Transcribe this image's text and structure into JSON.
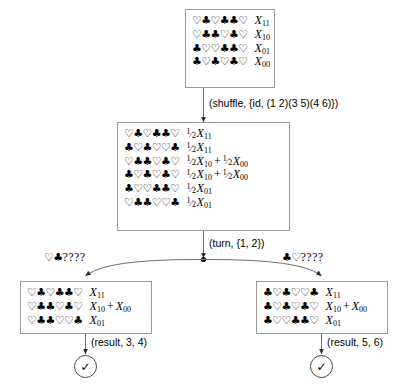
{
  "diagram": {
    "nodes": {
      "initial_state": {
        "rows": [
          {
            "cards": "♡♣♡♣♣♡",
            "value": "X",
            "sub": "11"
          },
          {
            "cards": "♡♣♣♡♣♡",
            "value": "X",
            "sub": "10"
          },
          {
            "cards": "♣♡♡♣♣♡",
            "value": "X",
            "sub": "01"
          },
          {
            "cards": "♣♡♣♡♣♡",
            "value": "X",
            "sub": "00"
          }
        ]
      },
      "shuffled_state": {
        "rows": [
          {
            "cards": "♡♣♡♣♣♡",
            "terms": [
              {
                "coef": "1/2",
                "value": "X",
                "sub": "11"
              }
            ]
          },
          {
            "cards": "♣♡♣♡♡♣",
            "terms": [
              {
                "coef": "1/2",
                "value": "X",
                "sub": "11"
              }
            ]
          },
          {
            "cards": "♡♣♣♡♣♡",
            "terms": [
              {
                "coef": "1/2",
                "value": "X",
                "sub": "10"
              },
              {
                "coef": "1/2",
                "value": "X",
                "sub": "00"
              }
            ]
          },
          {
            "cards": "♣♡♣♡♣♡",
            "terms": [
              {
                "coef": "1/2",
                "value": "X",
                "sub": "10"
              },
              {
                "coef": "1/2",
                "value": "X",
                "sub": "00"
              }
            ]
          },
          {
            "cards": "♣♡♡♣♣♡",
            "terms": [
              {
                "coef": "1/2",
                "value": "X",
                "sub": "01"
              }
            ]
          },
          {
            "cards": "♡♣♣♡♡♣",
            "terms": [
              {
                "coef": "1/2",
                "value": "X",
                "sub": "01"
              }
            ]
          }
        ]
      },
      "left_state": {
        "rows": [
          {
            "cards": "♡♣♡♣♣♡",
            "terms": [
              {
                "value": "X",
                "sub": "11"
              }
            ]
          },
          {
            "cards": "♡♣♣♡♣♡",
            "terms": [
              {
                "value": "X",
                "sub": "10"
              },
              {
                "value": "X",
                "sub": "00"
              }
            ]
          },
          {
            "cards": "♡♣♣♡♡♣",
            "terms": [
              {
                "value": "X",
                "sub": "01"
              }
            ]
          }
        ]
      },
      "right_state": {
        "rows": [
          {
            "cards": "♣♡♣♡♡♣",
            "terms": [
              {
                "value": "X",
                "sub": "11"
              }
            ]
          },
          {
            "cards": "♣♡♣♡♣♡",
            "terms": [
              {
                "value": "X",
                "sub": "10"
              },
              {
                "value": "X",
                "sub": "00"
              }
            ]
          },
          {
            "cards": "♣♡♡♣♣♡",
            "terms": [
              {
                "value": "X",
                "sub": "01"
              }
            ]
          }
        ]
      },
      "left_result": {
        "symbol": "✓"
      },
      "right_result": {
        "symbol": "✓"
      }
    },
    "edges": {
      "shuffle_label": "(shuffle, {id, (1 2)(3 5)(4 6)})",
      "turn_label": "(turn, {1, 2})",
      "left_branch_suits": "♡♣",
      "left_branch_unknown": "????",
      "right_branch_suits": "♣♡",
      "right_branch_unknown": "????",
      "left_result_label": "(result, 3, 4)",
      "right_result_label": "(result, 5, 6)"
    }
  }
}
